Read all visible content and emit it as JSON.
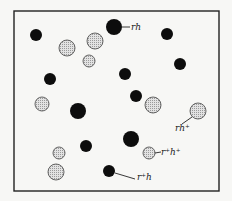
{
  "diagram": {
    "box": {
      "x": 14,
      "y": 11,
      "w": 205,
      "h": 180
    },
    "colors": {
      "dark": "#0d0d0d",
      "light_fill": "#d4d4d4",
      "light_stroke": "#555555",
      "line": "#222222"
    },
    "dark_particles": [
      {
        "cx": 36,
        "cy": 35,
        "r": 6
      },
      {
        "cx": 114,
        "cy": 27,
        "r": 8
      },
      {
        "cx": 167,
        "cy": 34,
        "r": 6
      },
      {
        "cx": 180,
        "cy": 64,
        "r": 6
      },
      {
        "cx": 50,
        "cy": 79,
        "r": 6
      },
      {
        "cx": 125,
        "cy": 74,
        "r": 6
      },
      {
        "cx": 136,
        "cy": 96,
        "r": 6
      },
      {
        "cx": 78,
        "cy": 111,
        "r": 8
      },
      {
        "cx": 131,
        "cy": 139,
        "r": 8
      },
      {
        "cx": 86,
        "cy": 146,
        "r": 6
      },
      {
        "cx": 109,
        "cy": 171,
        "r": 6
      }
    ],
    "light_particles": [
      {
        "cx": 67,
        "cy": 48,
        "r": 8
      },
      {
        "cx": 95,
        "cy": 41,
        "r": 8
      },
      {
        "cx": 89,
        "cy": 61,
        "r": 6
      },
      {
        "cx": 42,
        "cy": 104,
        "r": 7
      },
      {
        "cx": 153,
        "cy": 105,
        "r": 8
      },
      {
        "cx": 198,
        "cy": 111,
        "r": 8
      },
      {
        "cx": 59,
        "cy": 153,
        "r": 6
      },
      {
        "cx": 149,
        "cy": 153,
        "r": 6
      },
      {
        "cx": 56,
        "cy": 172,
        "r": 8
      }
    ],
    "labels": [
      {
        "id": "rh",
        "base": "r",
        "sub": "h",
        "text": "rh",
        "x": 131,
        "y": 30
      },
      {
        "id": "rh-plus",
        "text": "rh⁺",
        "x": 175,
        "y": 131
      },
      {
        "id": "r-plus-h-plus",
        "text": "r⁺h⁺",
        "x": 161,
        "y": 155
      },
      {
        "id": "r-plus-h",
        "text": "r⁺h",
        "x": 137,
        "y": 180
      }
    ],
    "leaders": [
      {
        "x1": 122,
        "y1": 27,
        "x2": 130,
        "y2": 27
      },
      {
        "x1": 192,
        "y1": 117,
        "x2": 182,
        "y2": 124
      },
      {
        "x1": 155,
        "y1": 153,
        "x2": 161,
        "y2": 152
      },
      {
        "x1": 115,
        "y1": 173,
        "x2": 135,
        "y2": 179
      }
    ]
  }
}
